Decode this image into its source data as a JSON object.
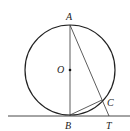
{
  "diagram": {
    "title": "",
    "circle": {
      "center": "O",
      "cx": 70,
      "cy": 70,
      "r": 45
    },
    "points": {
      "A": {
        "label": "A",
        "x": 70,
        "y": 25,
        "lx": 66,
        "ly": 20
      },
      "O": {
        "label": "O",
        "x": 70,
        "y": 70,
        "lx": 57,
        "ly": 73
      },
      "B": {
        "label": "B",
        "x": 70,
        "y": 115,
        "lx": 65,
        "ly": 128
      },
      "C": {
        "label": "C",
        "x": 102,
        "y": 100,
        "lx": 107,
        "ly": 106
      },
      "T": {
        "label": "T",
        "x": 108,
        "y": 116,
        "lx": 106,
        "ly": 128
      }
    },
    "segments": [
      {
        "from": "A",
        "to": "B",
        "name": "diameter-AB"
      },
      {
        "from": "A",
        "to": "T",
        "name": "secant-AT"
      },
      {
        "from": "B",
        "to": "C",
        "name": "chord-BC"
      }
    ],
    "tangent_line": {
      "y": 116,
      "x1": 8,
      "x2": 130,
      "name": "tangent-at-B"
    },
    "colors": {
      "stroke": "#333333",
      "circle_stroke": "#222222",
      "background": "#ffffff"
    }
  }
}
